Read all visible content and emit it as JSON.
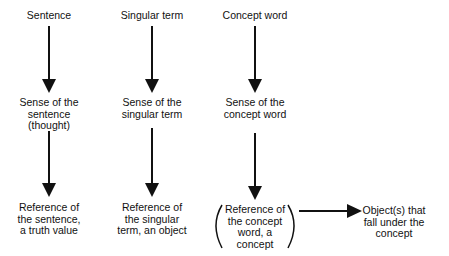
{
  "columns": [
    {
      "term": "Sentence",
      "sense": "Sense of the\nsentence\n(thought)",
      "reference": "Reference of\nthe sentence,\na truth value"
    },
    {
      "term": "Singular term",
      "sense": "Sense of the\nsingular term",
      "reference": "Reference of\nthe singular\nterm, an object"
    },
    {
      "term": "Concept word",
      "sense": "Sense of the\nconcept word",
      "reference": "Reference of\nthe concept\nword, a\nconcept"
    }
  ],
  "extension": "Object(s) that\nfall under the\nconcept",
  "colors": {
    "ink": "#111111",
    "background": "#ffffff"
  }
}
